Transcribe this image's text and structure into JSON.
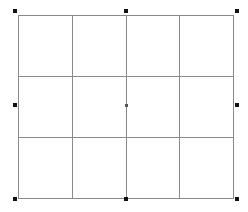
{
  "table": {
    "rows": 3,
    "cols": 4,
    "cells": [
      [
        "",
        "",
        "",
        ""
      ],
      [
        "",
        "",
        "",
        ""
      ],
      [
        "",
        "",
        "",
        ""
      ]
    ],
    "border_color": "#8a8a8a"
  },
  "selection": {
    "handles": [
      {
        "name": "top-left",
        "x": 13,
        "y": 9
      },
      {
        "name": "top-center",
        "x": 124,
        "y": 9
      },
      {
        "name": "top-right",
        "x": 235,
        "y": 9
      },
      {
        "name": "middle-left",
        "x": 13,
        "y": 103
      },
      {
        "name": "center",
        "x": 125,
        "y": 104
      },
      {
        "name": "middle-right",
        "x": 235,
        "y": 103
      },
      {
        "name": "bottom-left",
        "x": 13,
        "y": 197
      },
      {
        "name": "bottom-center",
        "x": 124,
        "y": 197
      },
      {
        "name": "bottom-right",
        "x": 235,
        "y": 197
      }
    ]
  }
}
